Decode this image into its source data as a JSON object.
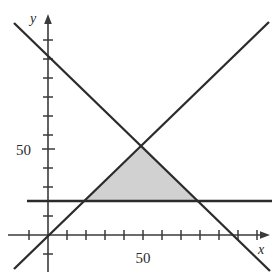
{
  "figure": {
    "background_color": "#ffffff",
    "line_color": "#2b2b2b",
    "axis_color": "#3a3a3a",
    "shade_color": "#c9c9c9"
  },
  "axes": {
    "x_label": "x",
    "y_label": "y",
    "x_tick_label": "50",
    "y_tick_label": "50",
    "origin_px": {
      "x": 48,
      "y": 235
    },
    "tick_spacing_px": 19,
    "x_axis_start_px": 8,
    "x_axis_end_px": 272,
    "y_axis_top_px": 18,
    "y_axis_bottom_px": 272
  },
  "chart_data": {
    "type": "line",
    "title": "",
    "xlabel": "x",
    "ylabel": "y",
    "xlim": [
      -20,
      120
    ],
    "ylim": [
      -25,
      115
    ],
    "xticks": [
      0,
      10,
      20,
      30,
      40,
      50,
      60,
      70,
      80,
      90,
      100,
      110
    ],
    "yticks": [
      -10,
      0,
      10,
      20,
      30,
      40,
      50,
      60,
      70,
      80,
      90,
      100
    ],
    "xtick_labels": [
      "",
      "",
      "",
      "",
      "",
      "50",
      "",
      "",
      "",
      "",
      "",
      ""
    ],
    "ytick_labels": [
      "",
      "",
      "",
      "",
      "",
      "50",
      "",
      "",
      "",
      "",
      "",
      ""
    ],
    "grid": false,
    "legend": false,
    "series": [
      {
        "name": "rising-line",
        "type": "line",
        "description": "line through the origin with positive slope",
        "x": [
          -18,
          116
        ],
        "y": [
          -18,
          116
        ]
      },
      {
        "name": "falling-line",
        "type": "line",
        "description": "line with negative slope crossing x-axis near x=100",
        "x": [
          -18,
          118
        ],
        "y": [
          118,
          -18
        ]
      },
      {
        "name": "horizontal-line",
        "type": "line",
        "description": "horizontal line at y = 18",
        "x": [
          -21,
          118
        ],
        "y": [
          18,
          18
        ]
      }
    ],
    "shaded_region": {
      "name": "feasible-triangle",
      "fill": "#c9c9c9",
      "vertices_data": [
        {
          "x": 18,
          "y": 18
        },
        {
          "x": 82,
          "y": 18
        },
        {
          "x": 50,
          "y": 50
        }
      ],
      "vertices_px": [
        {
          "x": 85,
          "y": 201
        },
        {
          "x": 198,
          "y": 201
        },
        {
          "x": 143,
          "y": 146
        }
      ]
    },
    "annotations": []
  }
}
